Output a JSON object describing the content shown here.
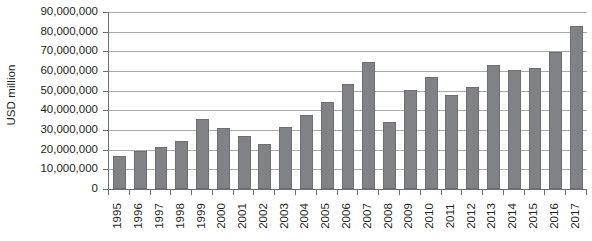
{
  "chart_data": {
    "type": "bar",
    "title": "",
    "xlabel": "",
    "ylabel": "USD million",
    "ylim": [
      0,
      90000000
    ],
    "ytick_step": 10000000,
    "ytick_labels": [
      "90,000,000",
      "80,000,000",
      "70,000,000",
      "60,000,000",
      "50,000,000",
      "40,000,000",
      "30,000,000",
      "20,000,000",
      "10,000,000",
      "0"
    ],
    "ytick_values": [
      90000000,
      80000000,
      70000000,
      60000000,
      50000000,
      40000000,
      30000000,
      20000000,
      10000000,
      0
    ],
    "grid": true,
    "legend": false,
    "legend_position": "none",
    "categories": [
      "1995",
      "1996",
      "1997",
      "1998",
      "1999",
      "2000",
      "2001",
      "2002",
      "2003",
      "2004",
      "2005",
      "2006",
      "2007",
      "2008",
      "2009",
      "2010",
      "2011",
      "2012",
      "2013",
      "2014",
      "2015",
      "2016",
      "2017"
    ],
    "values": [
      17000000,
      19500000,
      21500000,
      24500000,
      35500000,
      31000000,
      27000000,
      23000000,
      31500000,
      37500000,
      44000000,
      53500000,
      64500000,
      34000000,
      50500000,
      57000000,
      48000000,
      52000000,
      63000000,
      60500000,
      61500000,
      69500000,
      83000000
    ],
    "colors": {
      "bar_fill": "#808285",
      "bar_stroke": "#6d6e71",
      "gridline": "#a7a9ac",
      "axis": "#6d6e71",
      "text": "#231f20",
      "background": "#ffffff"
    }
  }
}
